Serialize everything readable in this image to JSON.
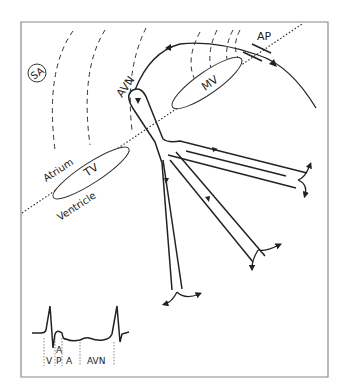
{
  "diagram": {
    "title": "",
    "labels": {
      "sa": "SA",
      "avn": "AVN",
      "mv": "MV",
      "ap": "AP",
      "tv": "TV",
      "atrium": "Atrium",
      "ventricle": "Ventricle"
    },
    "ecg_segments": [
      {
        "id": "v",
        "label": "V"
      },
      {
        "id": "ap",
        "label_top": "A",
        "label_bottom": "P"
      },
      {
        "id": "a",
        "label": "A"
      },
      {
        "id": "avn",
        "label": "AVN"
      }
    ],
    "colors": {
      "stroke": "#222222",
      "frame": "#888888",
      "background": "#ffffff"
    }
  }
}
